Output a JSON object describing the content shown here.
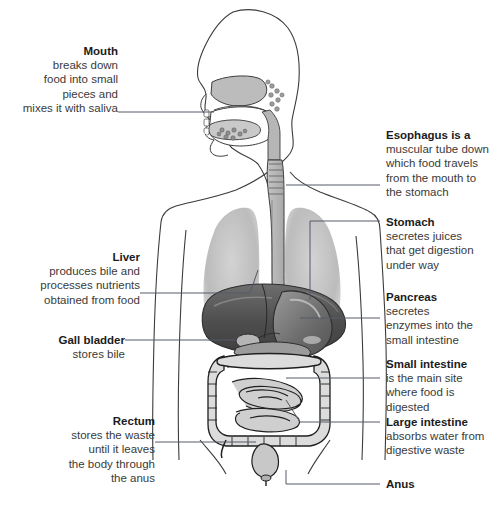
{
  "figure": {
    "view": "side profile head with frontal torso, grayscale anatomical illustration",
    "colors": {
      "background": "#ffffff",
      "outline": "#3c3c3c",
      "lung": "#b9b9b9",
      "organ_dark": "#4a4a4a",
      "organ_mid": "#8a8a8a",
      "organ_light": "#cfcfcf",
      "intestine_fill": "#d8d8d8",
      "leader_line": "#555a66",
      "title_text": "#1b1b1b",
      "body_text": "#3a3a3a"
    }
  },
  "labels": {
    "mouth": {
      "title": "Mouth",
      "lines": [
        "breaks down",
        "food into small",
        "pieces and",
        "mixes it with saliva"
      ],
      "side": "left"
    },
    "liver": {
      "title": "Liver",
      "lines": [
        "produces bile and",
        "processes nutrients",
        "obtained from food"
      ],
      "side": "left"
    },
    "gall_bladder": {
      "title": "Gall bladder",
      "lines": [
        "stores bile"
      ],
      "side": "left"
    },
    "rectum": {
      "title": "Rectum",
      "lines": [
        "stores the waste",
        "until it leaves",
        "the body through",
        "the anus"
      ],
      "side": "left"
    },
    "esophagus": {
      "title": "Esophagus is a",
      "lines": [
        "muscular tube down",
        "which food travels",
        "from the mouth to",
        "the stomach"
      ],
      "side": "right"
    },
    "stomach": {
      "title": "Stomach",
      "lines": [
        "secretes juices",
        "that get digestion",
        "under way"
      ],
      "side": "right"
    },
    "pancreas": {
      "title": "Pancreas",
      "lines": [
        "secretes",
        "enzymes into the",
        "small intestine"
      ],
      "side": "right"
    },
    "small_intestine": {
      "title": "Small intestine",
      "lines": [
        "is the main site",
        "where food is",
        "digested"
      ],
      "side": "right"
    },
    "large_intestine": {
      "title": "Large intestine",
      "lines": [
        "absorbs water from",
        "digestive waste"
      ],
      "side": "right"
    },
    "anus": {
      "title": "Anus",
      "lines": [],
      "side": "right"
    }
  },
  "caption": {
    "text": ""
  }
}
